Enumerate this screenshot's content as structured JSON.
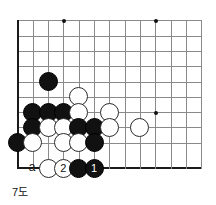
{
  "diagram": {
    "caption": "7도",
    "type": "go-board-problem",
    "board": {
      "columns": 13,
      "rows": 10,
      "origin_corner": "bottom-left",
      "grid_color": "#8a8a8a",
      "edge_color": "#1a1a1a",
      "star_points": [
        {
          "col": 3,
          "row": 0
        },
        {
          "col": 9,
          "row": 0
        },
        {
          "col": 9,
          "row": 6
        }
      ]
    },
    "stones": [
      {
        "color": "black",
        "col": 2,
        "row": 4,
        "label": ""
      },
      {
        "color": "white",
        "col": 4,
        "row": 5,
        "label": ""
      },
      {
        "color": "black",
        "col": 1,
        "row": 6,
        "label": ""
      },
      {
        "color": "black",
        "col": 2,
        "row": 6,
        "label": ""
      },
      {
        "color": "black",
        "col": 3,
        "row": 6,
        "label": ""
      },
      {
        "color": "white",
        "col": 4,
        "row": 6,
        "label": ""
      },
      {
        "color": "white",
        "col": 6,
        "row": 6,
        "label": ""
      },
      {
        "color": "black",
        "col": 1,
        "row": 7,
        "label": ""
      },
      {
        "color": "white",
        "col": 2,
        "row": 7,
        "label": ""
      },
      {
        "color": "white",
        "col": 3,
        "row": 7,
        "label": ""
      },
      {
        "color": "black",
        "col": 4,
        "row": 7,
        "label": ""
      },
      {
        "color": "black",
        "col": 5,
        "row": 7,
        "label": ""
      },
      {
        "color": "white",
        "col": 6,
        "row": 7,
        "label": ""
      },
      {
        "color": "white",
        "col": 8,
        "row": 7,
        "label": ""
      },
      {
        "color": "black",
        "col": 0,
        "row": 8,
        "label": ""
      },
      {
        "color": "white",
        "col": 1,
        "row": 8,
        "label": ""
      },
      {
        "color": "white",
        "col": 3,
        "row": 8,
        "label": ""
      },
      {
        "color": "white",
        "col": 4,
        "row": 8,
        "label": ""
      },
      {
        "color": "black",
        "col": 5,
        "row": 8,
        "label": ""
      },
      {
        "color": "white",
        "col": 2,
        "row": 9,
        "label": ""
      },
      {
        "color": "white",
        "col": 3,
        "row": 9,
        "label": "2"
      },
      {
        "color": "black",
        "col": 4,
        "row": 9,
        "label": ""
      },
      {
        "color": "black",
        "col": 5,
        "row": 9,
        "label": "1"
      }
    ],
    "point_labels": [
      {
        "text": "a",
        "col": 1,
        "row": 9
      }
    ]
  }
}
